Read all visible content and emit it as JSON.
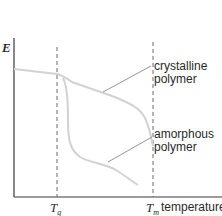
{
  "diagram": {
    "title": "",
    "y_axis": {
      "label": "E"
    },
    "x_axis": {
      "label": "temperature"
    },
    "markers": [
      {
        "id": "glass-transition",
        "symbol": "T",
        "subscript": "g"
      },
      {
        "id": "melting",
        "symbol": "T",
        "subscript": "m"
      }
    ],
    "curves": [
      {
        "id": "crystalline",
        "label_line1": "crystalline",
        "label_line2": "polymer",
        "color": "#d4d4d4"
      },
      {
        "id": "amorphous",
        "label_line1": "amorphous",
        "label_line2": "polymer",
        "color": "#d4d4d4"
      }
    ],
    "colors": {
      "axes": "#3a3a3a",
      "dashed": "#6a6a6a",
      "curve": "#d2d2d2",
      "leader": "#8a8a8a",
      "text": "#2a2a2a"
    }
  }
}
